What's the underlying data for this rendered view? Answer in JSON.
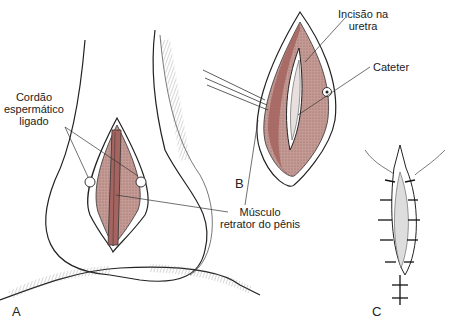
{
  "figure": {
    "panels": [
      {
        "id": "A",
        "label": "A"
      },
      {
        "id": "B",
        "label": "B"
      },
      {
        "id": "C",
        "label": "C"
      }
    ],
    "labels": {
      "cordao_line1": "Cordão",
      "cordao_line2": "espermático",
      "cordao_line3": "ligado",
      "incisao_line1": "Incisão na",
      "incisao_line2": "uretra",
      "cateter": "Cateter",
      "musculo_line1": "Músculo",
      "musculo_line2": "retrator do pênis"
    },
    "colors": {
      "tissue": "#b98a86",
      "muscle": "#a5645f",
      "ink": "#222222"
    }
  }
}
